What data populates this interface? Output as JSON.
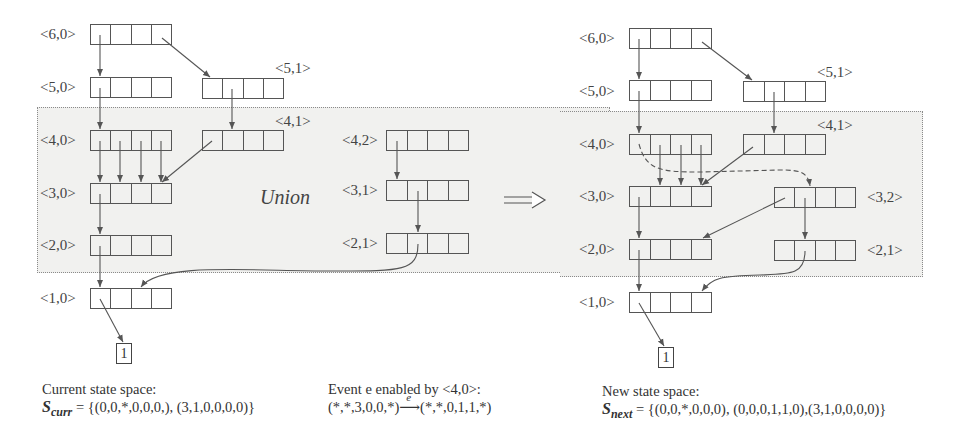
{
  "figure": {
    "union_label": "Union",
    "transform_arrow": "⟹",
    "left": {
      "nodes": [
        {
          "id": "<6,0>",
          "label": "<6,0>"
        },
        {
          "id": "<5,0>",
          "label": "<5,0>"
        },
        {
          "id": "<5,1>",
          "label": "<5,1>"
        },
        {
          "id": "<4,0>",
          "label": "<4,0>"
        },
        {
          "id": "<4,1>",
          "label": "<4,1>"
        },
        {
          "id": "<4,2>",
          "label": "<4,2>"
        },
        {
          "id": "<3,0>",
          "label": "<3,0>"
        },
        {
          "id": "<3,1>",
          "label": "<3,1>"
        },
        {
          "id": "<2,0>",
          "label": "<2,0>"
        },
        {
          "id": "<2,1>",
          "label": "<2,1>"
        },
        {
          "id": "<1,0>",
          "label": "<1,0>"
        }
      ],
      "terminal": "1",
      "caption": {
        "line1": "Current state space:",
        "set_symbol": "S",
        "set_subscript": "curr",
        "set_value": " = {(0,0,*,0,0,0,), (3,1,0,0,0,0)}"
      }
    },
    "middle": {
      "caption": {
        "line1": "Event e enabled by <4,0>:",
        "from": "(*,*,3,0,0,*)",
        "arrow_label": "e",
        "arrow": "⟶",
        "to": "(*,*,0,1,1,*)"
      }
    },
    "right": {
      "nodes": [
        {
          "id": "<6,0>",
          "label": "<6,0>"
        },
        {
          "id": "<5,0>",
          "label": "<5,0>"
        },
        {
          "id": "<5,1>",
          "label": "<5,1>"
        },
        {
          "id": "<4,0>",
          "label": "<4,0>"
        },
        {
          "id": "<4,1>",
          "label": "<4,1>"
        },
        {
          "id": "<3,0>",
          "label": "<3,0>"
        },
        {
          "id": "<3,2>",
          "label": "<3,2>"
        },
        {
          "id": "<2,0>",
          "label": "<2,0>"
        },
        {
          "id": "<2,1>",
          "label": "<2,1>"
        },
        {
          "id": "<1,0>",
          "label": "<1,0>"
        }
      ],
      "terminal": "1",
      "caption": {
        "line1": "New state space:",
        "set_symbol": "S",
        "set_subscript": "next",
        "set_value": " = {(0,0,*,0,0,0), (0,0,0,1,1,0),(3,1,0,0,0,0)}"
      }
    },
    "colors": {
      "line": "#555555",
      "region_fill": "#f1f1ef",
      "region_border": "#8a8a8a"
    }
  }
}
